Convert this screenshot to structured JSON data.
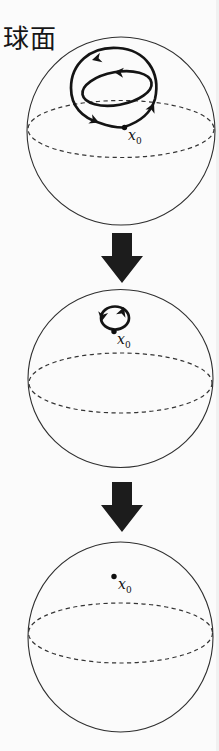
{
  "figure": {
    "title": "球面",
    "colors": {
      "ink": "#141414",
      "outline": "#2f2f2f",
      "background": "#fbfbfb"
    },
    "point_labels": [
      {
        "base": "x",
        "sub": "0"
      },
      {
        "base": "x",
        "sub": "0"
      },
      {
        "base": "x",
        "sub": "0"
      }
    ]
  }
}
